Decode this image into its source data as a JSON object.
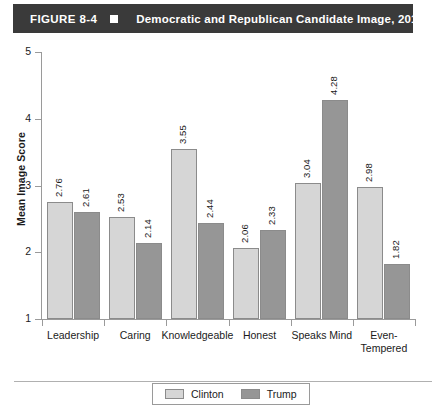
{
  "header": {
    "figure_number": "FIGURE 8-4",
    "bullet": "square-marker",
    "title": "Democratic and Republican Candidate Image, 2016"
  },
  "chart_data": {
    "type": "bar",
    "title": "Democratic and Republican Candidate Image, 2016",
    "xlabel": "",
    "ylabel": "Mean Image Score",
    "ylim": [
      1,
      5
    ],
    "yticks": [
      "1",
      "2",
      "3",
      "4",
      "5"
    ],
    "grid": false,
    "legend_position": "bottom-center",
    "categories": [
      "Leadership",
      "Caring",
      "Knowledgeable",
      "Honest",
      "Speaks Mind",
      "Even-\nTempered"
    ],
    "series": [
      {
        "name": "Clinton",
        "color": "#d6d6d6",
        "values": [
          2.76,
          2.53,
          3.55,
          2.06,
          3.04,
          2.98
        ],
        "labels": [
          "2.76",
          "2.53",
          "3.55",
          "2.06",
          "3.04",
          "2.98"
        ]
      },
      {
        "name": "Trump",
        "color": "#969696",
        "values": [
          2.61,
          2.14,
          2.44,
          2.33,
          4.28,
          1.82
        ],
        "labels": [
          "2.61",
          "2.14",
          "2.44",
          "2.33",
          "4.28",
          "1.82"
        ]
      }
    ]
  }
}
